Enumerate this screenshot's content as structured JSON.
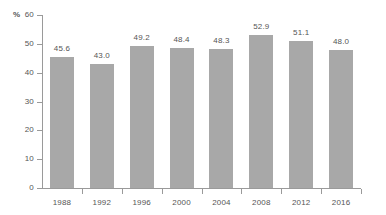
{
  "chart_data": {
    "type": "bar",
    "title": "",
    "subtitle": "",
    "xlabel": "",
    "ylabel": "%",
    "unit_label": "%",
    "categories": [
      "1988",
      "1992",
      "1996",
      "2000",
      "2004",
      "2008",
      "2012",
      "2016"
    ],
    "values": [
      45.6,
      43.0,
      49.2,
      48.4,
      48.3,
      52.9,
      51.1,
      48.0
    ],
    "value_labels": [
      "45.6",
      "43.0",
      "49.2",
      "48.4",
      "48.3",
      "52.9",
      "51.1",
      "48.0"
    ],
    "ylim": [
      0,
      60
    ],
    "ytick_values": [
      0,
      10,
      20,
      30,
      40,
      50,
      60
    ],
    "ytick_labels": [
      "0",
      "10",
      "20",
      "30",
      "40",
      "50",
      "60"
    ],
    "grid": false,
    "legend": false,
    "legend_position": "none",
    "series": [
      {
        "name": "",
        "color": "#a8a8a8",
        "values": [
          45.6,
          43.0,
          49.2,
          48.4,
          48.3,
          52.9,
          51.1,
          48.0
        ]
      }
    ],
    "colors": {
      "bar_fill": "#a8a8a8",
      "axis": "#9a9a9a",
      "text": "#555555",
      "background": "#ffffff"
    }
  }
}
